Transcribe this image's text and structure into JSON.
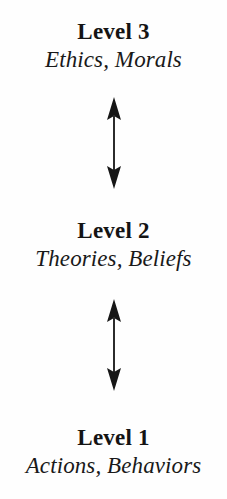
{
  "diagram": {
    "background_color": "#fefefe",
    "ink_color": "#161616",
    "levels": [
      {
        "id": "level-3",
        "title": "Level 3",
        "subtitle": "Ethics, Morals"
      },
      {
        "id": "level-2",
        "title": "Level 2",
        "subtitle": "Theories, Beliefs"
      },
      {
        "id": "level-1",
        "title": "Level 1",
        "subtitle": "Actions, Behaviors"
      }
    ],
    "connectors": [
      {
        "id": "connector-3-2",
        "icon": "double-headed-vertical-arrow",
        "from": "Level 3",
        "to": "Level 2"
      },
      {
        "id": "connector-2-1",
        "icon": "double-headed-vertical-arrow",
        "from": "Level 2",
        "to": "Level 1"
      }
    ]
  }
}
